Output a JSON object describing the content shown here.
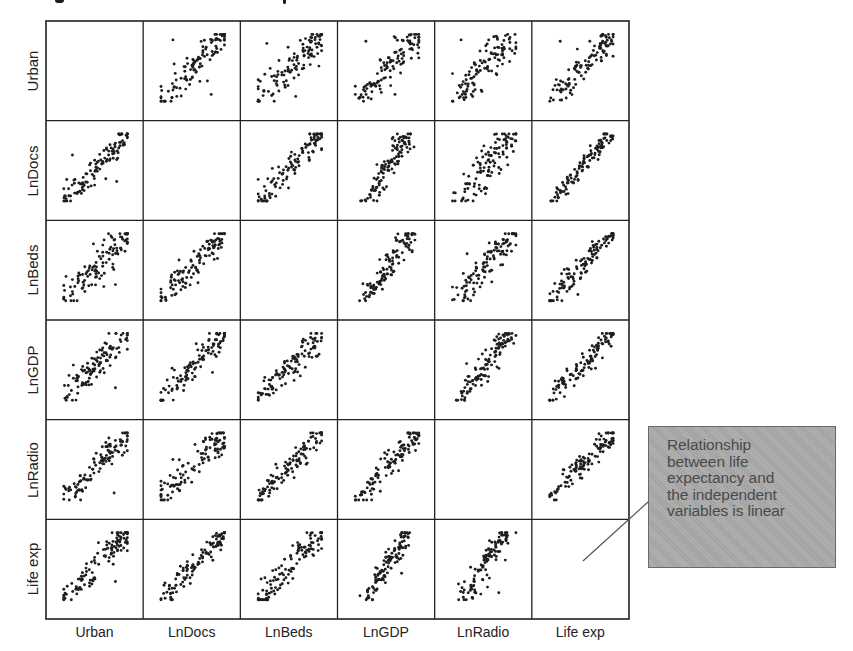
{
  "figure": {
    "title_visible": "",
    "title_note": "title clipped at top edge; only glyph descenders visible"
  },
  "chart_data": {
    "type": "scatter",
    "subtype": "scatterplot-matrix",
    "title": "",
    "variables": [
      "Urban",
      "LnDocs",
      "LnBeds",
      "LnGDP",
      "LnRadio",
      "Life exp"
    ],
    "row_labels": [
      "Urban",
      "LnDocs",
      "LnBeds",
      "LnGDP",
      "LnRadio",
      "Life exp"
    ],
    "col_labels": [
      "Urban",
      "LnDocs",
      "LnBeds",
      "LnGDP",
      "LnRadio",
      "Life exp"
    ],
    "diagonal": "empty",
    "grid": false,
    "axis_ticks": false,
    "approx_points_per_panel": 110,
    "panels": [
      {
        "row": 0,
        "col": 1,
        "y": "Urban",
        "x": "LnDocs",
        "relationship": "positive",
        "spread": 0.18,
        "slope": 1.1,
        "outliers": [
          [
            0.2,
            0.9
          ],
          [
            0.78,
            0.12
          ]
        ]
      },
      {
        "row": 0,
        "col": 2,
        "y": "Urban",
        "x": "LnBeds",
        "relationship": "positive",
        "spread": 0.22,
        "slope": 0.9,
        "outliers": [
          [
            0.15,
            0.85
          ]
        ]
      },
      {
        "row": 0,
        "col": 3,
        "y": "Urban",
        "x": "LnGDP",
        "relationship": "positive",
        "spread": 0.17,
        "slope": 1.1,
        "outliers": [
          [
            0.18,
            0.88
          ],
          [
            0.62,
            0.12
          ]
        ]
      },
      {
        "row": 0,
        "col": 4,
        "y": "Urban",
        "x": "LnRadio",
        "relationship": "positive",
        "spread": 0.2,
        "slope": 1.3,
        "outliers": [
          [
            0.15,
            0.9
          ]
        ]
      },
      {
        "row": 0,
        "col": 5,
        "y": "Urban",
        "x": "Life exp",
        "relationship": "positive",
        "spread": 0.18,
        "slope": 1.1,
        "outliers": [
          [
            0.18,
            0.88
          ]
        ]
      },
      {
        "row": 1,
        "col": 0,
        "y": "LnDocs",
        "x": "Urban",
        "relationship": "positive",
        "spread": 0.16,
        "slope": 0.9,
        "outliers": [
          [
            0.82,
            0.3
          ],
          [
            0.15,
            0.68
          ]
        ]
      },
      {
        "row": 1,
        "col": 2,
        "y": "LnDocs",
        "x": "LnBeds",
        "relationship": "positive",
        "spread": 0.16,
        "slope": 1.2,
        "outliers": []
      },
      {
        "row": 1,
        "col": 3,
        "y": "LnDocs",
        "x": "LnGDP",
        "relationship": "positive",
        "spread": 0.12,
        "slope": 1.8,
        "outliers": []
      },
      {
        "row": 1,
        "col": 4,
        "y": "LnDocs",
        "x": "LnRadio",
        "relationship": "positive",
        "spread": 0.22,
        "slope": 1.4,
        "outliers": [
          [
            0.72,
            0.5
          ]
        ]
      },
      {
        "row": 1,
        "col": 5,
        "y": "LnDocs",
        "x": "Life exp",
        "relationship": "positive",
        "spread": 0.1,
        "slope": 1.3,
        "outliers": []
      },
      {
        "row": 2,
        "col": 0,
        "y": "LnBeds",
        "x": "Urban",
        "relationship": "positive",
        "spread": 0.2,
        "slope": 0.7,
        "outliers": [
          [
            0.8,
            0.25
          ],
          [
            0.15,
            0.15
          ]
        ]
      },
      {
        "row": 2,
        "col": 1,
        "y": "LnBeds",
        "x": "LnDocs",
        "relationship": "positive",
        "spread": 0.16,
        "slope": 0.9,
        "outliers": [
          [
            0.25,
            0.12
          ]
        ]
      },
      {
        "row": 2,
        "col": 3,
        "y": "LnBeds",
        "x": "LnGDP",
        "relationship": "positive",
        "spread": 0.13,
        "slope": 1.5,
        "outliers": []
      },
      {
        "row": 2,
        "col": 4,
        "y": "LnBeds",
        "x": "LnRadio",
        "relationship": "positive",
        "spread": 0.18,
        "slope": 1.3,
        "outliers": [
          [
            0.78,
            0.72
          ]
        ]
      },
      {
        "row": 2,
        "col": 5,
        "y": "LnBeds",
        "x": "Life exp",
        "relationship": "positive",
        "spread": 0.15,
        "slope": 1.2,
        "outliers": []
      },
      {
        "row": 3,
        "col": 0,
        "y": "LnGDP",
        "x": "Urban",
        "relationship": "positive",
        "spread": 0.15,
        "slope": 0.75,
        "outliers": [
          [
            0.8,
            0.2
          ]
        ]
      },
      {
        "row": 3,
        "col": 1,
        "y": "LnGDP",
        "x": "LnDocs",
        "relationship": "positive",
        "spread": 0.14,
        "slope": 0.8,
        "outliers": [
          [
            0.8,
            0.42
          ]
        ]
      },
      {
        "row": 3,
        "col": 2,
        "y": "LnGDP",
        "x": "LnBeds",
        "relationship": "positive",
        "spread": 0.15,
        "slope": 0.8,
        "outliers": []
      },
      {
        "row": 3,
        "col": 4,
        "y": "LnGDP",
        "x": "LnRadio",
        "relationship": "positive",
        "spread": 0.15,
        "slope": 1.6,
        "outliers": [
          [
            0.78,
            0.78
          ]
        ]
      },
      {
        "row": 3,
        "col": 5,
        "y": "LnGDP",
        "x": "Life exp",
        "relationship": "positive",
        "spread": 0.12,
        "slope": 0.9,
        "outliers": []
      },
      {
        "row": 4,
        "col": 0,
        "y": "LnRadio",
        "x": "Urban",
        "relationship": "positive",
        "spread": 0.15,
        "slope": 0.6,
        "outliers": [
          [
            0.78,
            0.12
          ],
          [
            0.72,
            0.82
          ]
        ]
      },
      {
        "row": 4,
        "col": 1,
        "y": "LnRadio",
        "x": "LnDocs",
        "relationship": "positive",
        "spread": 0.17,
        "slope": 0.6,
        "outliers": [
          [
            0.2,
            0.6
          ]
        ]
      },
      {
        "row": 4,
        "col": 2,
        "y": "LnRadio",
        "x": "LnBeds",
        "relationship": "positive",
        "spread": 0.15,
        "slope": 0.9,
        "outliers": [
          [
            0.72,
            0.8
          ]
        ]
      },
      {
        "row": 4,
        "col": 3,
        "y": "LnRadio",
        "x": "LnGDP",
        "relationship": "positive",
        "spread": 0.14,
        "slope": 1.0,
        "outliers": []
      },
      {
        "row": 4,
        "col": 5,
        "y": "LnRadio",
        "x": "Life exp",
        "relationship": "positive",
        "spread": 0.14,
        "slope": 0.9,
        "outliers": [
          [
            0.7,
            0.82
          ]
        ]
      },
      {
        "row": 5,
        "col": 0,
        "y": "Life exp",
        "x": "Urban",
        "relationship": "positive",
        "spread": 0.17,
        "slope": 0.9,
        "outliers": [
          [
            0.8,
            0.28
          ]
        ]
      },
      {
        "row": 5,
        "col": 1,
        "y": "Life exp",
        "x": "LnDocs",
        "relationship": "positive",
        "spread": 0.12,
        "slope": 1.1,
        "outliers": [
          [
            0.2,
            0.12
          ]
        ]
      },
      {
        "row": 5,
        "col": 2,
        "y": "Life exp",
        "x": "LnBeds",
        "relationship": "positive",
        "spread": 0.16,
        "slope": 1.1,
        "outliers": []
      },
      {
        "row": 5,
        "col": 3,
        "y": "Life exp",
        "x": "LnGDP",
        "relationship": "positive",
        "spread": 0.12,
        "slope": 2.0,
        "outliers": [
          [
            0.72,
            0.4
          ]
        ]
      },
      {
        "row": 5,
        "col": 4,
        "y": "Life exp",
        "x": "LnRadio",
        "relationship": "positive",
        "spread": 0.14,
        "slope": 1.8,
        "outliers": [
          [
            0.72,
            0.12
          ],
          [
            0.55,
            0.2
          ]
        ]
      }
    ],
    "annotation": {
      "text": "Relationship between life expectancy and the independent variables is linear",
      "points_to": "Life exp / Life exp diagonal cell"
    }
  },
  "callout": {
    "lines": [
      "Relationship",
      "between life",
      "expectancy and",
      "the independent",
      "variables is linear"
    ],
    "fill": "#a9a9a9",
    "text_color": "#4a4a4a"
  },
  "colors": {
    "frame": "#222222",
    "point": "#1e1e1e",
    "leader_line": "#555555"
  }
}
